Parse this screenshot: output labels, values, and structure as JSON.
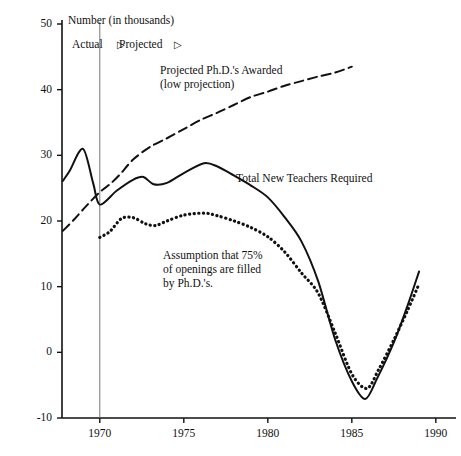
{
  "chart_data": {
    "type": "line",
    "title": "",
    "xlabel": "",
    "ylabel": "Number (in thousands)",
    "xlim": [
      1967.75,
      1991.2
    ],
    "ylim": [
      -10,
      50
    ],
    "grid": false,
    "legend_position": "inline-annotations",
    "y_ticks": [
      50,
      40,
      30,
      20,
      10,
      0,
      -10
    ],
    "y_tick_labels": [
      "50",
      "40",
      "30",
      "20",
      "10",
      "0",
      "-10"
    ],
    "x_ticks": [
      1970,
      1975,
      1980,
      1985,
      1990
    ],
    "x_tick_labels": [
      "1970",
      "1975",
      "1980",
      "1985",
      "1990"
    ],
    "divider_year": 1970,
    "annotations": [
      {
        "name": "actual-phase",
        "text": "Actual",
        "arrow": "▷"
      },
      {
        "name": "projected-phase",
        "text": "Projected",
        "arrow": "▷"
      },
      {
        "name": "phd-series-label",
        "line1": "Projected Ph.D.'s Awarded",
        "line2": "(low projection)"
      },
      {
        "name": "teachers-series-label",
        "line1": "Total New Teachers Required"
      },
      {
        "name": "assumption-note",
        "line1": "Assumption that 75%",
        "line2": "of openings are filled",
        "line3": "by Ph.D.'s."
      }
    ],
    "series": [
      {
        "name": "Projected Ph.D.'s Awarded (low projection)",
        "style": "dashed",
        "color": "#111111",
        "x": [
          1967.8,
          1968.5,
          1969.2,
          1970.0,
          1970.6,
          1971.2,
          1972.0,
          1973.0,
          1974.0,
          1975.0,
          1976.0,
          1977.0,
          1978.0,
          1979.0,
          1980.0,
          1981.0,
          1982.0,
          1983.0,
          1984.0,
          1985.0
        ],
        "values": [
          18.5,
          20.3,
          22.3,
          24.4,
          25.6,
          27.1,
          29.4,
          31.3,
          32.6,
          34.0,
          35.4,
          36.5,
          37.7,
          38.9,
          39.7,
          40.6,
          41.3,
          42.0,
          42.6,
          43.5
        ]
      },
      {
        "name": "Total New Teachers Required",
        "style": "solid",
        "color": "#111111",
        "x": [
          1967.8,
          1968.2,
          1969.0,
          1969.6,
          1970.0,
          1971.0,
          1972.0,
          1972.6,
          1973.2,
          1974.0,
          1975.0,
          1976.2,
          1977.0,
          1978.0,
          1979.0,
          1980.0,
          1981.0,
          1982.0,
          1983.0,
          1984.0,
          1985.0,
          1985.8,
          1986.5,
          1987.5,
          1988.3,
          1989.0
        ],
        "values": [
          26.1,
          27.6,
          31.0,
          25.8,
          22.5,
          24.6,
          26.3,
          26.7,
          25.6,
          25.8,
          27.3,
          28.8,
          28.3,
          26.9,
          25.4,
          23.6,
          20.6,
          16.9,
          10.8,
          2.0,
          -4.4,
          -7.1,
          -4.0,
          1.5,
          7.0,
          12.3
        ]
      },
      {
        "name": "Assumption that 75% of openings are filled by Ph.D.'s",
        "style": "dotted",
        "color": "#111111",
        "x": [
          1970.0,
          1970.6,
          1971.3,
          1972.0,
          1972.7,
          1973.3,
          1974.0,
          1975.0,
          1976.2,
          1977.0,
          1978.0,
          1979.0,
          1980.0,
          1981.0,
          1982.0,
          1983.0,
          1984.0,
          1985.0,
          1985.9,
          1986.6,
          1987.5,
          1988.3,
          1989.0
        ],
        "values": [
          17.5,
          18.4,
          20.4,
          20.5,
          19.6,
          19.3,
          20.0,
          20.9,
          21.2,
          20.8,
          20.0,
          19.0,
          17.6,
          15.3,
          12.1,
          9.0,
          3.0,
          -3.3,
          -5.5,
          -2.6,
          1.9,
          6.3,
          10.4
        ]
      }
    ]
  },
  "layout": {
    "axis_unit_text": "Number (in thousands)"
  }
}
